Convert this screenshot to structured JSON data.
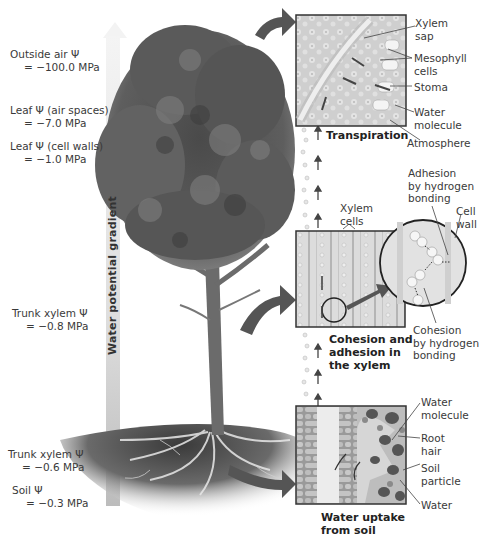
{
  "gradient": {
    "label": "Water potential gradient",
    "colors": {
      "arrow_top": "#f2f2f2",
      "arrow_bottom": "#bdbdbd"
    }
  },
  "potentials": [
    {
      "name": "Outside air Ψ",
      "value": "= −100.0 MPa"
    },
    {
      "name": "Leaf Ψ (air spaces)",
      "value": "= −7.0 MPa"
    },
    {
      "name": "Leaf Ψ (cell walls)",
      "value": "= −1.0 MPa"
    },
    {
      "name": "Trunk xylem Ψ",
      "value": "= −0.8 MPa"
    },
    {
      "name": "Trunk xylem Ψ",
      "value": "= −0.6 MPa"
    },
    {
      "name": "Soil Ψ",
      "value": "= −0.3 MPa"
    }
  ],
  "panels": {
    "leaf": {
      "caption": "Transpiration",
      "labels": [
        "Xylem sap",
        "Mesophyll cells",
        "Stoma",
        "Water molecule",
        "Atmosphere"
      ],
      "label_lines": [
        [
          "Xylem",
          "sap"
        ],
        [
          "Mesophyll",
          "cells"
        ],
        [
          "Stoma"
        ],
        [
          "Water",
          "molecule"
        ],
        [
          "Atmosphere"
        ]
      ]
    },
    "xylem": {
      "caption_lines": [
        "Cohesion and",
        "adhesion in",
        "the xylem"
      ],
      "labels": {
        "xylem_cells": [
          "Xylem",
          "cells"
        ],
        "adhesion": [
          "Adhesion",
          "by hydrogen",
          "bonding"
        ],
        "cell_wall": [
          "Cell",
          "wall"
        ],
        "cohesion": [
          "Cohesion",
          "by hydrogen",
          "bonding"
        ]
      }
    },
    "root": {
      "caption_lines": [
        "Water uptake",
        "from soil"
      ],
      "label_lines": [
        [
          "Water",
          "molecule"
        ],
        [
          "Root",
          "hair"
        ],
        [
          "Soil",
          "particle"
        ],
        [
          "Water"
        ]
      ]
    }
  }
}
